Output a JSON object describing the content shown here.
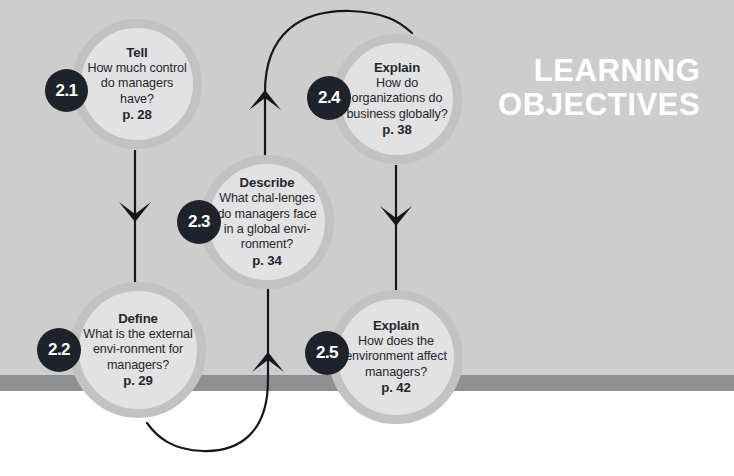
{
  "page": {
    "heading_line1": "LEARNING",
    "heading_line2": "OBJECTIVES",
    "background_color": "#cdcdcd",
    "stripe_color": "#8d8f90",
    "node_fill_color": "#e2e2e2",
    "node_ring_color": "#c2c2c2",
    "badge_color": "#1e232b",
    "text_color": "#23282e",
    "heading_color": "#ffffff"
  },
  "objectives": [
    {
      "number": "2.1",
      "verb": "Tell",
      "question": "How much control do managers have?",
      "page": "p. 28"
    },
    {
      "number": "2.2",
      "verb": "Define",
      "question": "What is the external envi-ronment for managers?",
      "page": "p. 29"
    },
    {
      "number": "2.3",
      "verb": "Describe",
      "question": "What chal-lenges do managers face in a global envi-ronment?",
      "page": "p. 34"
    },
    {
      "number": "2.4",
      "verb": "Explain",
      "question": "How do organizations do business globally?",
      "page": "p. 38"
    },
    {
      "number": "2.5",
      "verb": "Explain",
      "question": "How does the environment affect managers?",
      "page": "p. 42"
    }
  ],
  "connectors": [
    {
      "name": "arrow-2-1-to-2-2",
      "from": "2.1",
      "to": "2.2",
      "style": "straight-down"
    },
    {
      "name": "arrow-2-2-to-2-3",
      "from": "2.2",
      "to": "2.3",
      "style": "curved-up"
    },
    {
      "name": "arrow-2-3-to-2-4",
      "from": "2.3",
      "to": "2.4",
      "style": "curved-up"
    },
    {
      "name": "arrow-2-4-to-2-5",
      "from": "2.4",
      "to": "2.5",
      "style": "straight-down"
    }
  ]
}
